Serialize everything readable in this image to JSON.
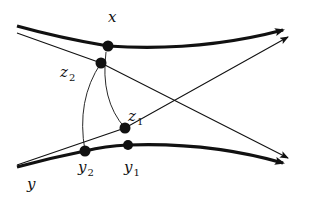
{
  "diagram": {
    "type": "geometric-geodesic-diagram",
    "colors": {
      "stroke": "#111111",
      "background": "#ffffff"
    },
    "labels": {
      "x": {
        "text": "x",
        "sub": ""
      },
      "y": {
        "text": "y",
        "sub": ""
      },
      "z1": {
        "text": "z",
        "sub": "1"
      },
      "z2": {
        "text": "z",
        "sub": "2"
      },
      "y1": {
        "text": "y",
        "sub": "1"
      },
      "y2": {
        "text": "y",
        "sub": "2"
      }
    },
    "points": [
      {
        "id": "x",
        "cx": 108,
        "cy": 46
      },
      {
        "id": "z2",
        "cx": 101,
        "cy": 63
      },
      {
        "id": "z1",
        "cx": 125,
        "cy": 128
      },
      {
        "id": "y2",
        "cx": 85,
        "cy": 151
      },
      {
        "id": "y1",
        "cx": 128,
        "cy": 145
      }
    ],
    "curves": [
      {
        "id": "ray-x",
        "kind": "thick-geodesic-ray",
        "d": "M17,26 Q60,38 108,46 Q200,52 280,31"
      },
      {
        "id": "ray-y",
        "kind": "thick-geodesic-ray",
        "d": "M17,167 Q50,158 85,151 Q105,146 128,145 Q210,142 280,162"
      },
      {
        "id": "line-z2",
        "kind": "thin-geodesic-ray",
        "d": "M17,33 L101,63 L286,157"
      },
      {
        "id": "line-z1",
        "kind": "thin-geodesic-ray",
        "d": "M17,165 L125,128 L286,38"
      },
      {
        "id": "arc-z2-y2",
        "kind": "thin-arc",
        "d": "M101,63 Q76,100 85,151"
      },
      {
        "id": "arc-x-z1",
        "kind": "thin-arc",
        "d": "M106,52 Q100,100 125,128"
      }
    ]
  }
}
